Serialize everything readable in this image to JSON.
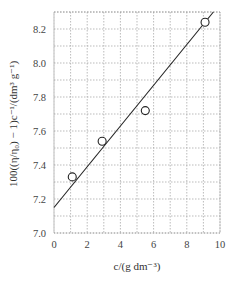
{
  "chart_data": {
    "type": "scatter",
    "title": "",
    "xlabel": "c/(g dm⁻³)",
    "ylabel": "100((η/η₀) − 1)c⁻¹/(dm³ g⁻¹)",
    "xlim": [
      0,
      10
    ],
    "ylim": [
      7.0,
      8.3
    ],
    "x_ticks": [
      0,
      2,
      4,
      6,
      8,
      10
    ],
    "x_tick_labels": [
      "0",
      "2",
      "4",
      "6",
      "8",
      "10"
    ],
    "y_ticks": [
      7.0,
      7.2,
      7.4,
      7.6,
      7.8,
      8.0,
      8.2
    ],
    "y_tick_labels": [
      "7.0",
      "7.2",
      "7.4",
      "7.6",
      "7.8",
      "8.0",
      "8.2"
    ],
    "grid": true,
    "grid_style": "dotted",
    "x_grid_step": 1,
    "y_grid_step": 0.1,
    "legend": null,
    "series": [
      {
        "name": "measured",
        "marker": "open-circle",
        "x": [
          1.1,
          2.9,
          5.5,
          9.1
        ],
        "y": [
          7.33,
          7.54,
          7.72,
          8.24
        ]
      },
      {
        "name": "linear fit",
        "type": "line",
        "x": [
          0,
          9.6
        ],
        "y": [
          7.15,
          8.3
        ]
      }
    ]
  }
}
